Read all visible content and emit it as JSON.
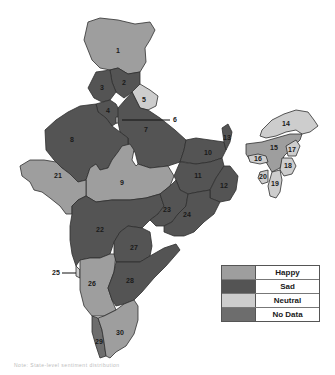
{
  "legend": {
    "items": [
      {
        "label": "Happy",
        "color": "#9e9e9e"
      },
      {
        "label": "Sad",
        "color": "#545454"
      },
      {
        "label": "Neutral",
        "color": "#cdcdcd"
      },
      {
        "label": "No Data",
        "color": "#6d6d6d"
      }
    ]
  },
  "regions": [
    {
      "id": "1",
      "category": "Happy"
    },
    {
      "id": "2",
      "category": "Sad"
    },
    {
      "id": "3",
      "category": "Sad"
    },
    {
      "id": "4",
      "category": "Sad"
    },
    {
      "id": "5",
      "category": "Neutral"
    },
    {
      "id": "6",
      "category": "Neutral"
    },
    {
      "id": "7",
      "category": "Sad"
    },
    {
      "id": "8",
      "category": "Sad"
    },
    {
      "id": "9",
      "category": "Happy"
    },
    {
      "id": "10",
      "category": "Sad"
    },
    {
      "id": "11",
      "category": "Sad"
    },
    {
      "id": "12",
      "category": "Sad"
    },
    {
      "id": "13",
      "category": "Sad"
    },
    {
      "id": "14",
      "category": "Neutral"
    },
    {
      "id": "15",
      "category": "Happy"
    },
    {
      "id": "16",
      "category": "Neutral"
    },
    {
      "id": "17",
      "category": "Neutral"
    },
    {
      "id": "18",
      "category": "Neutral"
    },
    {
      "id": "19",
      "category": "Neutral"
    },
    {
      "id": "20",
      "category": "Neutral"
    },
    {
      "id": "21",
      "category": "Happy"
    },
    {
      "id": "22",
      "category": "Sad"
    },
    {
      "id": "23",
      "category": "Sad"
    },
    {
      "id": "24",
      "category": "Sad"
    },
    {
      "id": "25",
      "category": "Neutral"
    },
    {
      "id": "26",
      "category": "Happy"
    },
    {
      "id": "27",
      "category": "Sad"
    },
    {
      "id": "28",
      "category": "Sad"
    },
    {
      "id": "29",
      "category": "No Data"
    },
    {
      "id": "30",
      "category": "Happy"
    }
  ],
  "callouts": [
    "6",
    "25"
  ],
  "caption": "Note: State-level sentiment distribution"
}
